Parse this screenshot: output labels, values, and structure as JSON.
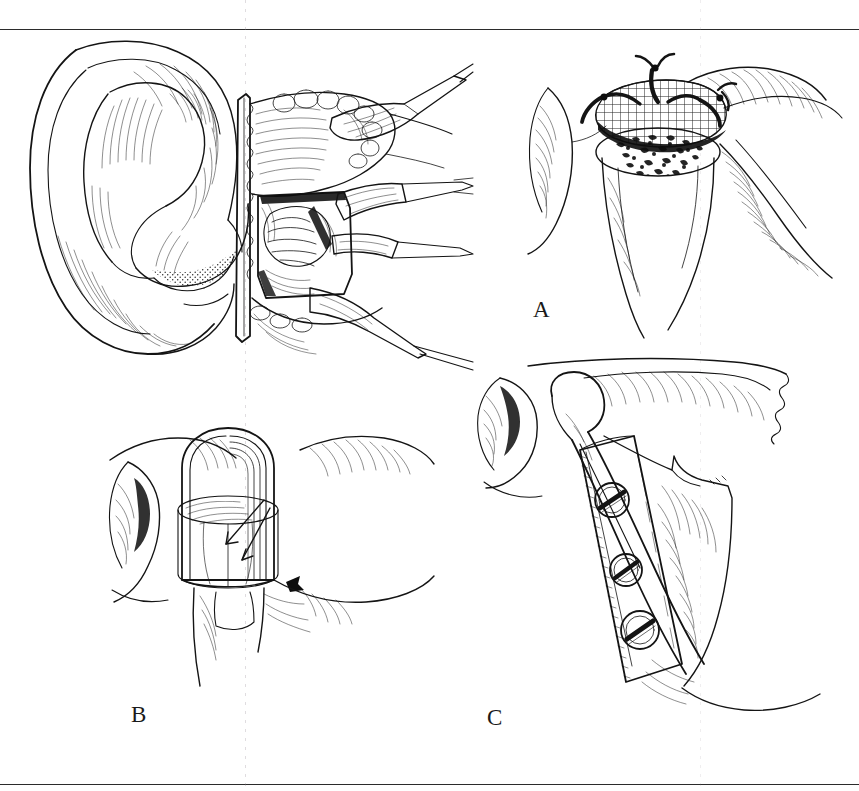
{
  "figure": {
    "kind": "surgical-illustration-plate",
    "medium": "pen-and-ink line drawing",
    "palette": {
      "ink": "#141414",
      "paper": "#ffffff",
      "rule": "#2b2b2b"
    },
    "title_visible": "",
    "caption_visible": "",
    "rules": {
      "top_y": 29,
      "bottom_y": 784
    },
    "panel_labels": {
      "a": "A",
      "b": "B",
      "c": "C"
    }
  },
  "panels": [
    {
      "id": "main",
      "label": "",
      "subject": "Preauricular surgical exposure of the temporomandibular joint",
      "elements": [
        "external ear (auricle) with helix, antihelix, concha, tragus, lobule",
        "preauricular incision flap retracted anteriorly",
        "exposed joint capsule and condylar head",
        "soft tissue retractors held by instruments",
        "parotid and temporal fascia margins"
      ]
    },
    {
      "id": "a",
      "label": "A",
      "subject": "Condylar stump with bone graft capped by wire mesh and secured with sutures",
      "elements": [
        "resected condylar neck stump",
        "cancellous bone graft surface",
        "crosshatched metal mesh tray",
        "three black circumferential sutures",
        "surrounding soft tissue with hatch shading"
      ]
    },
    {
      "id": "b",
      "label": "B",
      "subject": "Mesh tray seated over the condylar stump, arrows indicating seating direction",
      "elements": [
        "dome-shaped mesh tray outline",
        "cylindrical condylar stump inside tray",
        "directional arrows showing tray placement",
        "glenoid fossa and soft tissue contours"
      ]
    },
    {
      "id": "c",
      "label": "C",
      "subject": "Condylar prosthesis fixed to the mandibular ramus with a three-hole bone plate",
      "elements": [
        "condylar head prosthesis articulating in fossa",
        "straight bone plate along posterior ramus",
        "three slotted bone screws",
        "mandibular ramus and angle with hatch shading",
        "zygomatic arch above"
      ],
      "screw_count": 3
    }
  ]
}
